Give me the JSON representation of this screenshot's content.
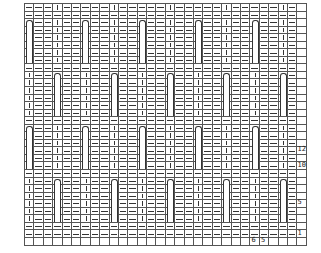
{
  "chart": {
    "columns": 30,
    "rows": 32,
    "cell_width": 9.4,
    "cell_height": 7.55,
    "band_height": 6,
    "cable_columns_band_a": [
      0,
      6,
      12,
      18,
      24
    ],
    "cable_columns_band_b": [
      3,
      9,
      15,
      21,
      27
    ],
    "band_a_starts": [
      2,
      16
    ],
    "band_b_starts": [
      9,
      23
    ],
    "dash_rows": [
      1,
      8,
      15,
      22,
      29,
      30
    ],
    "empty_rows": [
      31
    ],
    "empty_columns": [
      29
    ],
    "symbols": {
      "knit": "|",
      "purl": "—",
      "cable": "cable-loop"
    }
  },
  "row_labels": [
    {
      "text": "12",
      "row": 19
    },
    {
      "text": "10",
      "row": 21
    },
    {
      "text": "5",
      "row": 26
    },
    {
      "text": "1",
      "row": 30
    }
  ],
  "col_labels": [
    {
      "text": "6",
      "col": 24
    },
    {
      "text": "5",
      "col": 25
    }
  ]
}
